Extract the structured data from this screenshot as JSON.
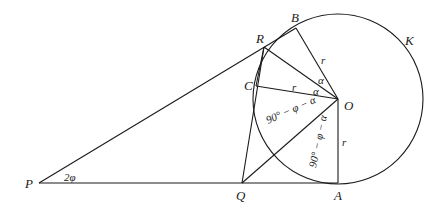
{
  "diagram": {
    "points": {
      "P": "P",
      "Q": "Q",
      "A": "A",
      "O": "O",
      "B": "B",
      "R": "R",
      "C": "C",
      "K": "K"
    },
    "labels": {
      "angle_P": "2φ",
      "r_OB": "r",
      "r_OC": "r",
      "r_OA": "r",
      "alpha_1": "α",
      "alpha_2": "α",
      "alpha_3": "α",
      "angle_QOC": "90° − φ − α",
      "angle_QOA": "90° − φ − α"
    }
  }
}
